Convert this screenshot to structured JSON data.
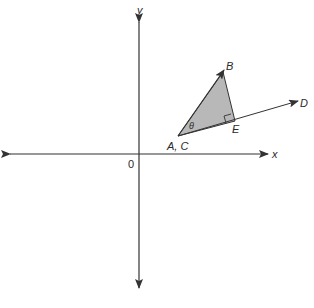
{
  "diagram": {
    "axes": {
      "x_label": "x",
      "y_label": "y",
      "origin_label": "0"
    },
    "points": {
      "origin_point": "A, C",
      "B": "B",
      "D": "D",
      "E": "E"
    },
    "angle_label": "θ",
    "colors": {
      "line": "#333333",
      "triangle_fill": "#b8b8b8",
      "background": "#ffffff"
    }
  }
}
